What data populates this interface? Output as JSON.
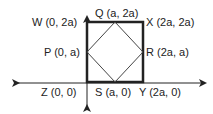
{
  "diagram": {
    "type": "coordinate-geometry",
    "colors": {
      "axis": "#222222",
      "square": "#222222",
      "diamond": "#444444",
      "text": "#222222",
      "background": "#ffffff"
    },
    "axes": {
      "origin_px": [
        87,
        83
      ],
      "x_axis": {
        "from_px": [
          12,
          83
        ],
        "to_px": [
          210,
          83
        ],
        "arrows": "both"
      },
      "y_axis": {
        "from_px": [
          87,
          12
        ],
        "to_px": [
          87,
          111
        ],
        "arrows": "both"
      }
    },
    "square": {
      "vertices": [
        "Z",
        "Y",
        "X",
        "W"
      ],
      "px": {
        "left": 87,
        "top": 22,
        "right": 143,
        "bottom": 82
      }
    },
    "inner_square": {
      "vertices": [
        "P",
        "Q",
        "R",
        "S"
      ]
    },
    "points": [
      {
        "id": "W",
        "label": "W (0, 2a)",
        "coords": [
          "0",
          "2a"
        ]
      },
      {
        "id": "Q",
        "label": "Q (a, 2a)",
        "coords": [
          "a",
          "2a"
        ]
      },
      {
        "id": "X",
        "label": "X (2a, 2a)",
        "coords": [
          "2a",
          "2a"
        ]
      },
      {
        "id": "P",
        "label": "P (0, a)",
        "coords": [
          "0",
          "a"
        ]
      },
      {
        "id": "R",
        "label": "R (2a, a)",
        "coords": [
          "2a",
          "a"
        ]
      },
      {
        "id": "Z",
        "label": "Z (0, 0)",
        "coords": [
          "0",
          "0"
        ]
      },
      {
        "id": "S",
        "label": "S (a, 0)",
        "coords": [
          "a",
          "0"
        ]
      },
      {
        "id": "Y",
        "label": "Y (2a, 0)",
        "coords": [
          "2a",
          "0"
        ]
      }
    ]
  }
}
